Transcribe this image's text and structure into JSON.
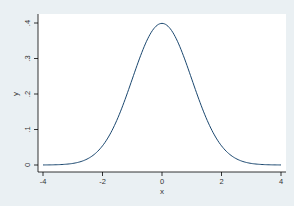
{
  "chart_data": {
    "type": "line",
    "title": "",
    "xlabel": "x",
    "ylabel": "y",
    "xlim": [
      -4,
      4
    ],
    "ylim": [
      0,
      0.4
    ],
    "grid": false,
    "legend": "none",
    "x_ticks": [
      -4,
      -2,
      0,
      2,
      4
    ],
    "x_tick_labels": [
      "-4",
      "-2",
      "0",
      "2",
      "4"
    ],
    "y_ticks": [
      0,
      0.1,
      0.2,
      0.3,
      0.4
    ],
    "y_tick_labels": [
      "0",
      ".1",
      ".2",
      ".3",
      ".4"
    ],
    "series": [
      {
        "name": "standard normal density",
        "x": [
          -4,
          -3.5,
          -3,
          -2.5,
          -2,
          -1.5,
          -1,
          -0.5,
          0,
          0.5,
          1,
          1.5,
          2,
          2.5,
          3,
          3.5,
          4
        ],
        "y": [
          0.0001,
          0.0009,
          0.0044,
          0.0175,
          0.054,
          0.1295,
          0.242,
          0.3521,
          0.3989,
          0.3521,
          0.242,
          0.1295,
          0.054,
          0.0175,
          0.0044,
          0.0009,
          0.0001
        ]
      }
    ],
    "colors": {
      "background": "#eaf0f3",
      "plot_area": "#ffffff",
      "line": "#1a476f",
      "axis": "#000000"
    }
  }
}
